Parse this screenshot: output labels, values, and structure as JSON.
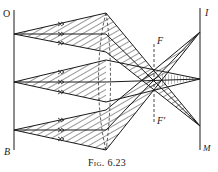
{
  "figure": {
    "caption": "Fig. 6.23",
    "labels": {
      "object_top": "O",
      "object_bottom": "B",
      "image_top": "I",
      "image_bottom": "M",
      "focal_upper": "F",
      "focal_lower": "F'"
    }
  },
  "geometry": {
    "object_line_x": 14,
    "image_line_x": 200,
    "lens_x": 106,
    "focal_line_x": 154,
    "object_points": [
      {
        "name": "top",
        "y": 34,
        "lens_hits": [
          13,
          34,
          52
        ],
        "image_y": 126
      },
      {
        "name": "middle",
        "y": 82,
        "lens_hits": [
          60,
          82,
          102
        ],
        "image_y": 79
      },
      {
        "name": "bottom",
        "y": 130,
        "lens_hits": [
          110,
          130,
          150
        ],
        "image_y": 32
      }
    ]
  },
  "colors": {
    "ink": "#1a1a1a",
    "background": "#ffffff"
  }
}
